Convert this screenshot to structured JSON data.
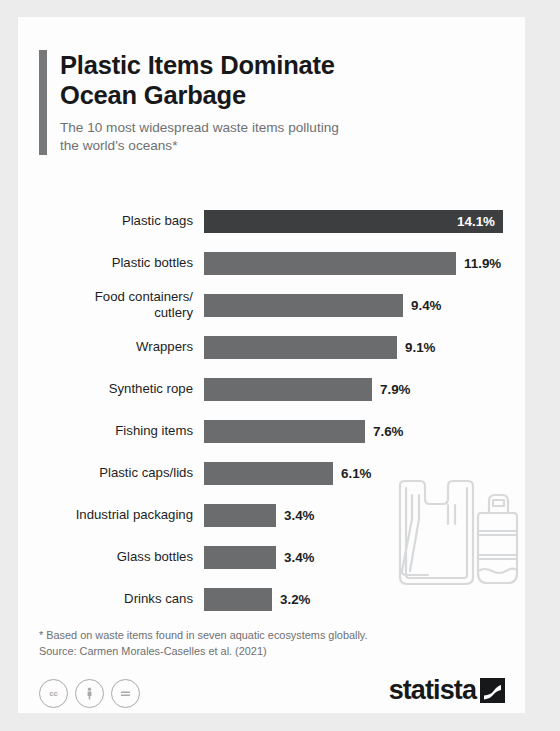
{
  "header": {
    "title": "Plastic Items Dominate\nOcean Garbage",
    "subtitle": "The 10 most widespread waste items polluting\nthe world's oceans*",
    "accent_color": "#777879"
  },
  "chart_data": {
    "type": "bar",
    "orientation": "horizontal",
    "title": "Plastic Items Dominate Ocean Garbage",
    "subtitle": "The 10 most widespread waste items polluting the world's oceans*",
    "xlabel": "",
    "ylabel": "",
    "xlim": [
      0,
      14.1
    ],
    "grid": false,
    "legend": false,
    "value_suffix": "%",
    "categories": [
      "Plastic bags",
      "Plastic bottles",
      "Food containers/\ncutlery",
      "Wrappers",
      "Synthetic rope",
      "Fishing items",
      "Plastic caps/lids",
      "Industrial packaging",
      "Glass bottles",
      "Drinks cans"
    ],
    "values": [
      14.1,
      11.9,
      9.4,
      9.1,
      7.9,
      7.6,
      6.1,
      3.4,
      3.4,
      3.2
    ],
    "value_labels": [
      "14.1%",
      "11.9%",
      "9.4%",
      "9.1%",
      "7.9%",
      "7.6%",
      "6.1%",
      "3.4%",
      "3.4%",
      "3.2%"
    ],
    "highlight_index": 0,
    "bar_color": "#6b6c6e",
    "highlight_color": "#3d3e40"
  },
  "footer": {
    "footnote": "* Based on waste items found in seven aquatic ecosystems globally.",
    "source": "Source: Carmen Morales-Caselles et al. (2021)",
    "cc_badges": [
      "CC",
      "BY",
      "ND"
    ],
    "logo_text": "statista"
  }
}
